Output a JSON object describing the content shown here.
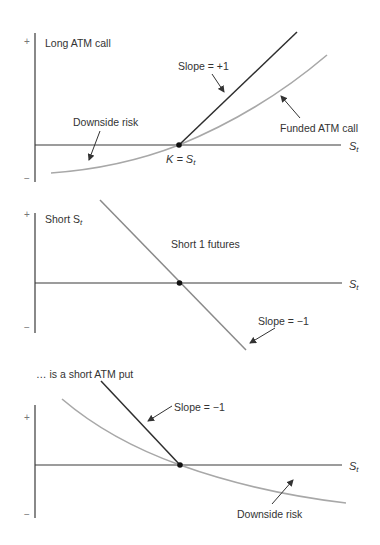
{
  "colors": {
    "axis": "#3a3a3a",
    "dark_line": "#2e2e2e",
    "grey_curve": "#a8a8a8",
    "text": "#333333",
    "dot": "#111111"
  },
  "panels": [
    {
      "title": "Long ATM call",
      "plus": "+",
      "minus": "−",
      "axis_label": "S",
      "axis_label_sub": "t",
      "annotations": {
        "slope": "Slope = +1",
        "downside": "Downside risk",
        "strike_prefix": "K = S",
        "strike_sub": "t",
        "funded": "Funded ATM call"
      }
    },
    {
      "title": "Short S",
      "title_sub": "t",
      "plus": "+",
      "minus": "−",
      "axis_label": "S",
      "axis_label_sub": "t",
      "annotations": {
        "futures": "Short 1 futures",
        "slope": "Slope = −1"
      }
    },
    {
      "title": "… is a short ATM put",
      "plus": "+",
      "minus": "−",
      "axis_label": "S",
      "axis_label_sub": "t",
      "annotations": {
        "slope": "Slope = −1",
        "downside": "Downside risk"
      }
    }
  ]
}
